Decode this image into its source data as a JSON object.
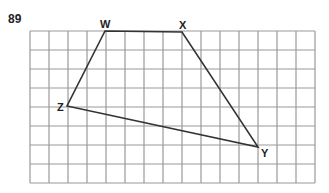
{
  "problem_number": "89",
  "grid": {
    "columns": 15,
    "rows": 8,
    "left": 30,
    "top": 31,
    "cell": 19,
    "line_color": "#999999"
  },
  "points": [
    {
      "label": "W",
      "x": 105,
      "y": 31,
      "lx": 100,
      "ly": 28
    },
    {
      "label": "X",
      "x": 182,
      "y": 32,
      "lx": 179,
      "ly": 29
    },
    {
      "label": "Y",
      "x": 258,
      "y": 147,
      "lx": 261,
      "ly": 157
    },
    {
      "label": "Z",
      "x": 67,
      "y": 106,
      "lx": 57,
      "ly": 111
    }
  ],
  "polygon_order": [
    "W",
    "X",
    "Y",
    "Z"
  ],
  "stroke_color": "#333333"
}
